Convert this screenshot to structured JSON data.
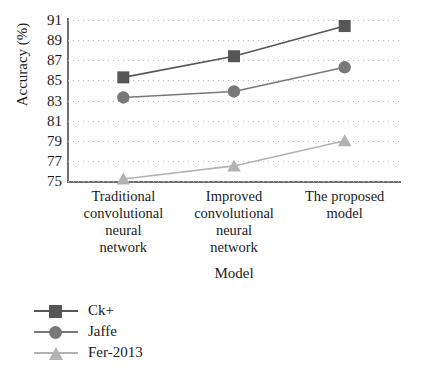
{
  "figure": {
    "caption_remnant": "",
    "background": "#ffffff"
  },
  "chart_data": {
    "type": "line",
    "title": "",
    "xlabel": "Model",
    "ylabel": "Accuracy (%)",
    "categories": [
      "Traditional convolutional neural network",
      "Improved convolutional neural network",
      "The proposed model"
    ],
    "category_lines": [
      [
        "Traditional",
        "convolutional",
        "neural",
        "network"
      ],
      [
        "Improved",
        "convolutional",
        "neural",
        "network"
      ],
      [
        "The proposed",
        "model"
      ]
    ],
    "ylim": [
      75,
      91
    ],
    "yticks": [
      91,
      89,
      87,
      85,
      83,
      81,
      79,
      77,
      75
    ],
    "grid": true,
    "grid_style": "dotted-horizontal",
    "legend_position": "bottom-left",
    "series": [
      {
        "name": "Ck+",
        "marker": "square",
        "color": "#565656",
        "values": [
          85.3,
          87.4,
          90.4
        ]
      },
      {
        "name": "Jaffe",
        "marker": "circle",
        "color": "#787878",
        "values": [
          83.3,
          83.9,
          86.3
        ]
      },
      {
        "name": "Fer-2013",
        "marker": "triangle",
        "color": "#b2b2b2",
        "values": [
          75.2,
          76.5,
          79.0
        ]
      }
    ]
  },
  "colors": {
    "axis": "#6f6f6f",
    "grid": "#b9b9b9",
    "text": "#1b1b1b",
    "ck_plus": "#565656",
    "jaffe": "#787878",
    "fer_2013": "#b2b2b2"
  }
}
